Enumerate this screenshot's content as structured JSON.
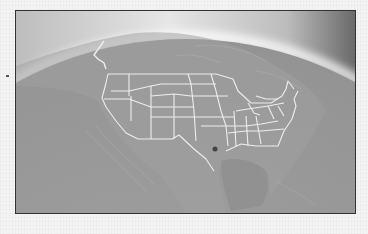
{
  "map": {
    "title": "",
    "region": "North America (globe view)",
    "features": [
      "United States state borders",
      "Mexico border",
      "Canada coastline",
      "Gulf of Mexico"
    ],
    "point_marker": "Texas / Gulf coast dot"
  },
  "colors": {
    "space": "#e8e8e8",
    "atmosphere_glow": "#ffffff",
    "ocean": "#8f8f8f",
    "land": "#9b9b9b",
    "borders": "#eeeeee",
    "frame_border": "#333333",
    "page_background": "#f4f4f4"
  }
}
